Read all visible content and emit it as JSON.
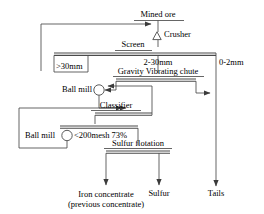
{
  "diagram": {
    "stroke_color": "#444444",
    "text_color": "#000000",
    "background": "#ffffff",
    "nodes": {
      "mined_ore": "Mined ore",
      "crusher": "Crusher",
      "screen": "Screen",
      "gravity_vibrating_chute": "Gravity Vibrating chute",
      "ball_mill_upper": "Ball mill",
      "classifier": "Classifier",
      "ball_mill_lower": "Ball mill",
      "sulfur_flotation": "Sulfur flotation"
    },
    "stream_labels": {
      "oversize": ">30mm",
      "midsize": "2-30mm",
      "fines": "0-2mm",
      "grind_fineness": "<200mesh 73%"
    },
    "products": {
      "iron_concentrate_line1": "Iron concentrate",
      "iron_concentrate_line2": "(previous concentrate)",
      "sulfur": "Sulfur",
      "tails": "Tails"
    },
    "icons": {
      "crusher": "triangle-icon",
      "ball_mill_upper": "circle-icon",
      "ball_mill_lower": "circle-icon"
    }
  }
}
